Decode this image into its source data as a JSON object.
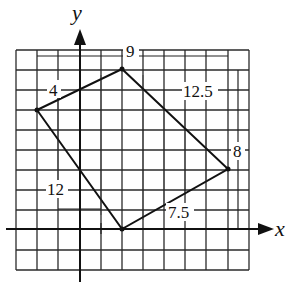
{
  "diagram": {
    "type": "quadrilateral-on-grid",
    "axes": {
      "x_label": "x",
      "y_label": "y"
    },
    "shape": {
      "fill": "#6e6e6e",
      "stroke": "#111111",
      "vertices": [
        {
          "name": "left",
          "px": [
            37,
            110
          ]
        },
        {
          "name": "top",
          "px": [
            122,
            70
          ]
        },
        {
          "name": "right",
          "px": [
            228,
            169
          ]
        },
        {
          "name": "bottom",
          "px": [
            122,
            229
          ]
        }
      ]
    },
    "labels": {
      "top_width": "9",
      "left_height": "4",
      "right_upper": "12.5",
      "right_height": "8",
      "left_lower": "12",
      "bottom_right": "7.5"
    },
    "grid": {
      "columns": 11,
      "rows": 11,
      "line_color": "#2a2a2a"
    }
  }
}
